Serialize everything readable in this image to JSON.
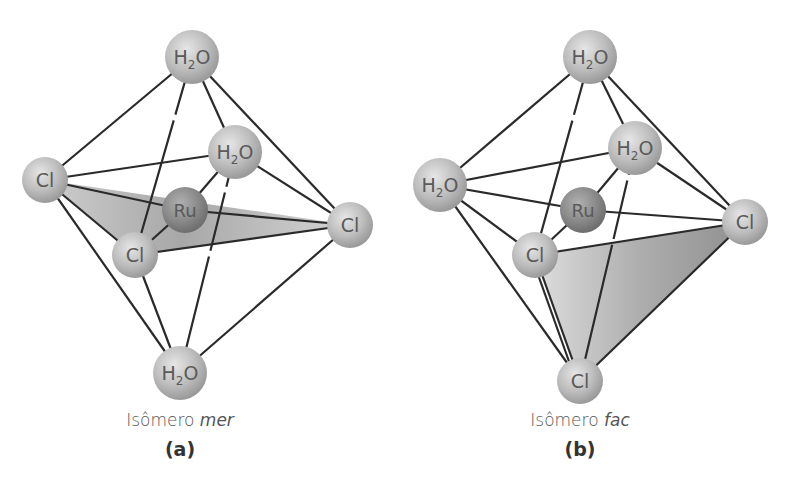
{
  "header": {
    "cut_off_subscripts": "3 2 3"
  },
  "colors": {
    "atom_fill": "#bdbdbd",
    "metal_fill": "#8f8f8f",
    "bond_line": "#2a2a2a",
    "plane_fill": "#a8a8a8",
    "caption": "#555555",
    "label": "#333333"
  },
  "panels": [
    {
      "id": "a",
      "caption_prefix": "Isômero ",
      "caption_italic": "mer",
      "label": "(a)",
      "center_metal": "Ru",
      "ligands": {
        "top": "H2O",
        "back": "H2O",
        "left": "Cl",
        "front": "Cl",
        "right": "Cl",
        "bottom": "H2O"
      }
    },
    {
      "id": "b",
      "caption_prefix": "Isômero ",
      "caption_italic": "fac",
      "label": "(b)",
      "center_metal": "Ru",
      "ligands": {
        "top": "H2O",
        "back": "H2O",
        "left": "H2O",
        "front": "Cl",
        "right": "Cl",
        "bottom": "Cl"
      }
    }
  ]
}
